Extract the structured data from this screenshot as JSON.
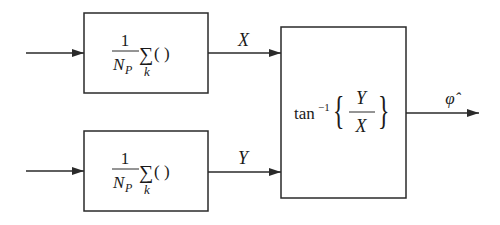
{
  "diagram": {
    "type": "block-diagram",
    "colors": {
      "stroke": "#2a2a2a",
      "text": "#1a1a1a",
      "background": "#ffffff"
    },
    "blocks": [
      {
        "id": "avg-top",
        "numerator": "1",
        "denominator_base": "N",
        "denominator_sub": "P",
        "operator": "∑",
        "operator_sub": "k",
        "operand": "( )"
      },
      {
        "id": "avg-bottom",
        "numerator": "1",
        "denominator_base": "N",
        "denominator_sub": "P",
        "operator": "∑",
        "operator_sub": "k",
        "operand": "( )"
      },
      {
        "id": "arctan",
        "func": "tan",
        "func_sup": "−1",
        "numerator": "Y",
        "denominator": "X",
        "open_brace": "{",
        "close_brace": "}"
      }
    ],
    "signals": {
      "top_output": "X",
      "bottom_output": "Y",
      "final_output": "φ̂"
    }
  }
}
